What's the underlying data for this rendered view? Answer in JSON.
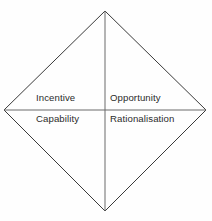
{
  "diagram": {
    "type": "fraud-diamond",
    "shape": "rhombus",
    "stroke_color": "#3a3a3a",
    "stroke_width": 1,
    "fill_color": "none",
    "background_color": "#fefefe",
    "text_color": "#2b2b2b",
    "vertices": {
      "top": {
        "x": 105,
        "y": 11
      },
      "right": {
        "x": 206,
        "y": 110
      },
      "bottom": {
        "x": 105,
        "y": 211
      },
      "left": {
        "x": 4,
        "y": 110
      }
    },
    "dividers": {
      "vertical": {
        "x1": 105,
        "y1": 11,
        "x2": 105,
        "y2": 211
      },
      "horizontal": {
        "x1": 4,
        "y1": 110,
        "x2": 206,
        "y2": 110
      }
    },
    "quadrants": [
      {
        "position": "top-left",
        "label": "Incentive"
      },
      {
        "position": "top-right",
        "label": "Opportunity"
      },
      {
        "position": "bottom-left",
        "label": "Capability"
      },
      {
        "position": "bottom-right",
        "label": "Rationalisation"
      }
    ]
  }
}
